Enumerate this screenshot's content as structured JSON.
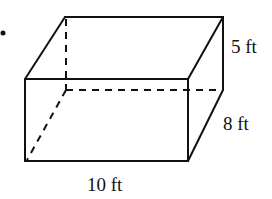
{
  "figure": {
    "type": "rectangular-prism",
    "bullet": "•",
    "dimensions": {
      "length": "10 ft",
      "width": "8 ft",
      "height": "5 ft"
    }
  }
}
